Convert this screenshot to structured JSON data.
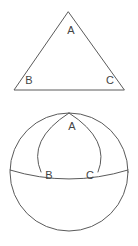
{
  "figure": {
    "background_color": "#ffffff",
    "stroke_color": "#5a5a5a",
    "label_color": "#444444",
    "width": 138,
    "height": 246
  },
  "plane_triangle": {
    "name": "plane-triangle",
    "vertices": {
      "A": {
        "label": "A",
        "x": 68,
        "y": 12,
        "label_x": 71,
        "label_y": 31
      },
      "B": {
        "label": "B",
        "x": 14,
        "y": 90,
        "label_x": 29,
        "label_y": 81
      },
      "C": {
        "label": "C",
        "x": 124,
        "y": 90,
        "label_x": 110,
        "label_y": 81
      }
    },
    "path": "M 68 12 L 14 90 L 124 90 Z"
  },
  "sphere": {
    "name": "sphere-figure",
    "outline": {
      "center_x": 69,
      "center_y": 172,
      "radius": 59
    },
    "equator": {
      "label": "equator-arc",
      "path": "M 10 170 Q 69 188 128 170"
    },
    "meridian_left": {
      "label": "meridian-arc-left",
      "path": "M 69 113 Q 27 140 41 172"
    },
    "meridian_right": {
      "label": "meridian-arc-right",
      "path": "M 69 113 Q 111 140 98 172"
    },
    "vertices": {
      "A": {
        "label": "A",
        "x": 69,
        "y": 113,
        "label_x": 72,
        "label_y": 127
      },
      "B": {
        "label": "B",
        "x": 41,
        "y": 172,
        "label_x": 49,
        "label_y": 176
      },
      "C": {
        "label": "C",
        "x": 98,
        "y": 172,
        "label_x": 90,
        "label_y": 176
      }
    }
  }
}
